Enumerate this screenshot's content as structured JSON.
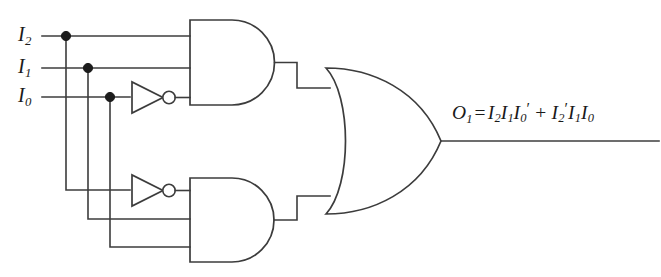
{
  "figure": {
    "name": "logic-circuit-diagram",
    "background_color": "#ffffff",
    "line_color": "#3c3c3c",
    "dot_color": "#1c1c1c"
  },
  "inputs": [
    {
      "id": "I2",
      "base": "I",
      "subscript": "2",
      "y": 36
    },
    {
      "id": "I1",
      "base": "I",
      "subscript": "1",
      "y": 68
    },
    {
      "id": "I0",
      "base": "I",
      "subscript": "0",
      "y": 97
    }
  ],
  "gates": {
    "and_top": {
      "label": "AND",
      "inputs": 3,
      "output_signal": "I2 I1 I0'"
    },
    "and_bottom": {
      "label": "AND",
      "inputs": 3,
      "output_signal": "I2' I1 I0"
    },
    "or_gate": {
      "label": "OR",
      "inputs": 2,
      "output_signal": "O1"
    },
    "inverter_top": {
      "label": "NOT",
      "inverts": "I0"
    },
    "inverter_bottom": {
      "label": "NOT",
      "inverts": "I2"
    }
  },
  "output": {
    "name": "O1",
    "base": "O",
    "subscript": "1",
    "equals": "=",
    "plus": "+",
    "term1": [
      {
        "base": "I",
        "subscript": "2",
        "prime": ""
      },
      {
        "base": "I",
        "subscript": "1",
        "prime": ""
      },
      {
        "base": "I",
        "subscript": "0",
        "prime": "′"
      }
    ],
    "term2": [
      {
        "base": "I",
        "subscript": "2",
        "prime": "′"
      },
      {
        "base": "I",
        "subscript": "1",
        "prime": ""
      },
      {
        "base": "I",
        "subscript": "0",
        "prime": ""
      }
    ],
    "expression_text": "O1 = I2I1I0' + I2'I1I0"
  }
}
